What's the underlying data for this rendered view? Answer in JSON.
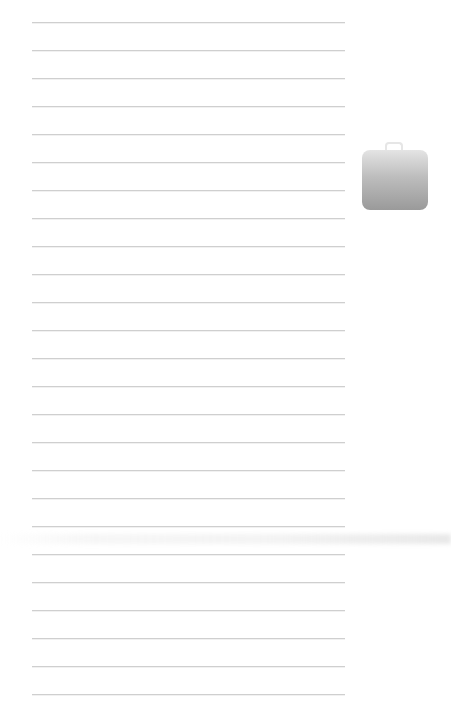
{
  "page": {
    "type": "ruled-notebook-page",
    "background_color": "#ffffff",
    "rule_color": "#cfcfcf",
    "rule_count": 25,
    "rule_spacing_px": 28,
    "first_rule_y": 22,
    "rule_left_x": 32,
    "rule_width": 313
  },
  "icons": [
    {
      "name": "briefcase-icon",
      "colors": [
        "#e4e4e4",
        "#9a9a9a"
      ]
    }
  ]
}
